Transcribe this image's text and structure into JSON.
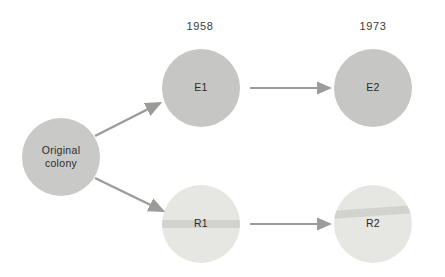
{
  "figure": {
    "background_color": "#ffffff",
    "width": 445,
    "height": 277
  },
  "timeline": {
    "columns": [
      {
        "id": "col-1958",
        "label": "1958",
        "x": 200,
        "y": 20
      },
      {
        "id": "col-1973",
        "label": "1973",
        "x": 373,
        "y": 20
      }
    ]
  },
  "nodes": [
    {
      "id": "original-colony",
      "label_line1": "Original",
      "label_line2": "colony",
      "cx": 61,
      "cy": 157,
      "r": 39,
      "fill": "#c9c9c7",
      "striped": false
    },
    {
      "id": "e1",
      "label": "E1",
      "cx": 201,
      "cy": 88,
      "r": 39,
      "fill": "#c6c6c4",
      "striped": false
    },
    {
      "id": "e2",
      "label": "E2",
      "cx": 373,
      "cy": 88,
      "r": 39,
      "fill": "#c6c6c4",
      "striped": false
    },
    {
      "id": "r1",
      "label": "R1",
      "cx": 201,
      "cy": 224,
      "r": 39,
      "fill": "#e6e6e3",
      "striped": true,
      "stripe_color": "#d2d2cf",
      "stripe_offset": 0,
      "stripe_height": 8,
      "stripe_angle": 0
    },
    {
      "id": "r2",
      "label": "R2",
      "cx": 373,
      "cy": 224,
      "r": 39,
      "fill": "#e6e6e3",
      "striped": true,
      "stripe_color": "#d2d2cf",
      "stripe_offset": -12,
      "stripe_height": 8,
      "stripe_angle": -4
    }
  ],
  "arrows": [
    {
      "id": "arrow-original-to-e1",
      "from": "original-colony",
      "to": "e1",
      "x1": 95,
      "y1": 136,
      "x2": 160,
      "y2": 103,
      "color": "#9b9b99"
    },
    {
      "id": "arrow-original-to-r1",
      "from": "original-colony",
      "to": "r1",
      "x1": 95,
      "y1": 178,
      "x2": 163,
      "y2": 211,
      "color": "#9b9b99"
    },
    {
      "id": "arrow-e1-to-e2",
      "from": "e1",
      "to": "e2",
      "x1": 250,
      "y1": 88,
      "x2": 330,
      "y2": 88,
      "color": "#9b9b99"
    },
    {
      "id": "arrow-r1-to-r2",
      "from": "r1",
      "to": "r2",
      "x1": 250,
      "y1": 224,
      "x2": 330,
      "y2": 224,
      "color": "#9b9b99"
    }
  ]
}
